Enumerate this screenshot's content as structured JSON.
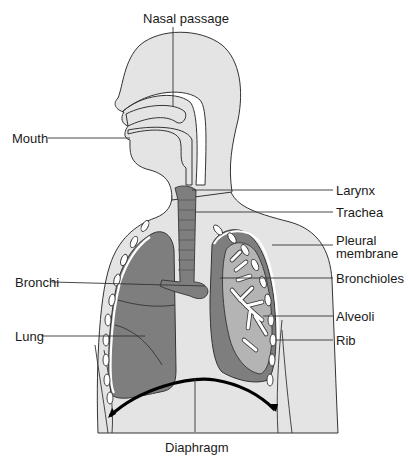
{
  "diagram": {
    "labels": {
      "nasal_passage": "Nasal passage",
      "mouth": "Mouth",
      "larynx": "Larynx",
      "trachea": "Trachea",
      "pleural_membrane_line1": "Pleural",
      "pleural_membrane_line2": "membrane",
      "bronchioles": "Bronchioles",
      "bronchi": "Bronchi",
      "alveoli": "Alveoli",
      "lung": "Lung",
      "rib": "Rib",
      "diaphragm": "Diaphragm"
    },
    "colors": {
      "skin": "#e4e4e4",
      "lung": "#7e7e7e",
      "lung_inner": "#b4b4b4",
      "outline": "#333333",
      "diaphragm": "#000000",
      "background": "#ffffff"
    }
  }
}
